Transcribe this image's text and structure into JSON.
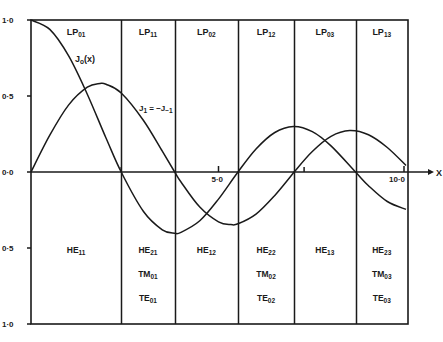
{
  "chart_data": {
    "type": "line",
    "title": "",
    "xlabel": "x",
    "ylabel": "",
    "xlim": [
      0,
      10
    ],
    "ylim": [
      -1,
      1
    ],
    "x_ticks": [
      {
        "value": 5.0,
        "label": "5·0"
      },
      {
        "value": 10.0,
        "label": "10·0"
      }
    ],
    "y_ticks": [
      {
        "value": 1.0,
        "label": "1·0"
      },
      {
        "value": 0.5,
        "label": "0·5"
      },
      {
        "value": 0.0,
        "label": "0·0"
      },
      {
        "value": -0.5,
        "label": "0·5"
      },
      {
        "value": -1.0,
        "label": "1·0"
      }
    ],
    "series": [
      {
        "name": "J0(x)",
        "label_main": "J",
        "label_sub": "o",
        "label_tail": "(x)",
        "x": [
          0,
          0.5,
          1,
          1.5,
          2,
          2.405,
          3,
          3.5,
          3.832,
          4,
          4.5,
          5,
          5.52,
          6,
          6.5,
          7,
          7.5,
          8,
          8.654,
          9,
          9.5,
          10
        ],
        "values": [
          1,
          0.938,
          0.765,
          0.512,
          0.224,
          0,
          -0.26,
          -0.38,
          -0.403,
          -0.397,
          -0.321,
          -0.178,
          0,
          0.151,
          0.26,
          0.3,
          0.266,
          0.172,
          0,
          -0.09,
          -0.194,
          -0.246
        ]
      },
      {
        "name": "J1 = -J-1",
        "label_main": "J",
        "label_sub": "1",
        "label_tail": " = −J",
        "x": [
          0,
          0.5,
          1,
          1.5,
          1.84,
          2,
          2.405,
          3,
          3.5,
          3.832,
          4,
          4.5,
          5,
          5.33,
          5.52,
          6,
          6.5,
          7,
          7.016,
          7.5,
          8,
          8.5,
          9,
          9.5,
          10
        ],
        "values": [
          0,
          0.242,
          0.44,
          0.558,
          0.582,
          0.577,
          0.52,
          0.339,
          0.137,
          0,
          -0.066,
          -0.231,
          -0.328,
          -0.346,
          -0.341,
          -0.277,
          -0.154,
          -0.005,
          0,
          0.135,
          0.235,
          0.273,
          0.245,
          0.161,
          0.043
        ]
      }
    ],
    "regions": [
      {
        "x_from": 0,
        "x_to": 2.405,
        "lp": "LP",
        "lp_sub": "01",
        "modes": [
          {
            "m": "HE",
            "s": "11"
          }
        ]
      },
      {
        "x_from": 2.405,
        "x_to": 3.832,
        "lp": "LP",
        "lp_sub": "11",
        "modes": [
          {
            "m": "HE",
            "s": "21"
          },
          {
            "m": "TM",
            "s": "01"
          },
          {
            "m": "TE",
            "s": "01"
          }
        ]
      },
      {
        "x_from": 3.832,
        "x_to": 5.52,
        "lp": "LP",
        "lp_sub": "02",
        "modes": [
          {
            "m": "HE",
            "s": "12"
          }
        ]
      },
      {
        "x_from": 5.52,
        "x_to": 7.016,
        "lp": "LP",
        "lp_sub": "12",
        "modes": [
          {
            "m": "HE",
            "s": "22"
          },
          {
            "m": "TM",
            "s": "02"
          },
          {
            "m": "TE",
            "s": "02"
          }
        ]
      },
      {
        "x_from": 7.016,
        "x_to": 8.654,
        "lp": "LP",
        "lp_sub": "03",
        "modes": [
          {
            "m": "HE",
            "s": "13"
          }
        ]
      },
      {
        "x_from": 8.654,
        "x_to": 10.0,
        "lp": "LP",
        "lp_sub": "13",
        "modes": [
          {
            "m": "HE",
            "s": "23"
          },
          {
            "m": "TM",
            "s": "03"
          },
          {
            "m": "TE",
            "s": "03"
          }
        ]
      }
    ],
    "grid": false,
    "legend": "inline labels"
  },
  "labels": {
    "x_axis": "X",
    "j1_sub_neg": "−1"
  }
}
